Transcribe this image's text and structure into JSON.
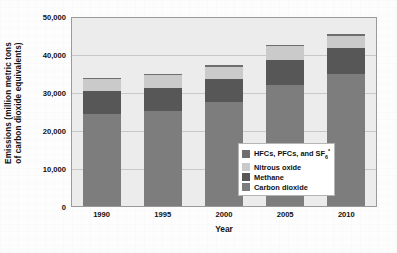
{
  "chart_data": {
    "type": "bar",
    "subtype": "stacked-bar",
    "title": "",
    "xlabel": "Year",
    "ylabel": "Emissions (million metric tons of carbon dioxide equivalents)",
    "ylabel_line1": "Emissions (million metric tons",
    "ylabel_line2": "of carbon dioxide equivalents)",
    "categories": [
      "1990",
      "1995",
      "2000",
      "2005",
      "2010"
    ],
    "ylim": [
      0,
      50000
    ],
    "yticks": [
      0,
      10000,
      20000,
      30000,
      40000,
      50000
    ],
    "ytick_labels": [
      "0",
      "10,000",
      "20,000",
      "30,000",
      "40,000",
      "50,000"
    ],
    "grid": true,
    "legend_position": "inside-right-middle",
    "series": [
      {
        "name": "Carbon dioxide",
        "color": "#7d7d7d",
        "values": [
          24400,
          25200,
          27600,
          32100,
          35000
        ]
      },
      {
        "name": "Methane",
        "color": "#575757",
        "values": [
          6300,
          6300,
          6100,
          6800,
          7000
        ]
      },
      {
        "name": "Nitrous oxide",
        "color": "#cacaca",
        "values": [
          3200,
          3400,
          3400,
          3600,
          3300
        ]
      },
      {
        "name": "HFCs, PFCs, and SF6*",
        "color": "#6e6e6e",
        "values": [
          200,
          300,
          300,
          300,
          500
        ]
      }
    ],
    "totals": [
      34100,
      35200,
      37400,
      42800,
      45800
    ]
  },
  "legend": {
    "items": [
      {
        "label_prefix": "HFCs, PFCs, and SF",
        "label_sub": "6",
        "label_sup": "*",
        "color": "#6e6e6e",
        "name": "hfcs-pfcs-sf6"
      },
      {
        "label_prefix": "Nitrous oxide",
        "label_sub": "",
        "label_sup": "",
        "color": "#cacaca",
        "name": "nitrous-oxide"
      },
      {
        "label_prefix": "Methane",
        "label_sub": "",
        "label_sup": "",
        "color": "#575757",
        "name": "methane"
      },
      {
        "label_prefix": "Carbon dioxide",
        "label_sub": "",
        "label_sup": "",
        "color": "#7d7d7d",
        "name": "carbon-dioxide"
      }
    ]
  },
  "style": {
    "plot_background": "#ececec",
    "plot_border": "#9a9a9a",
    "gridline_color": "#c8c8c8",
    "page_background": "#fdfdfd",
    "text_color": "#111111"
  }
}
